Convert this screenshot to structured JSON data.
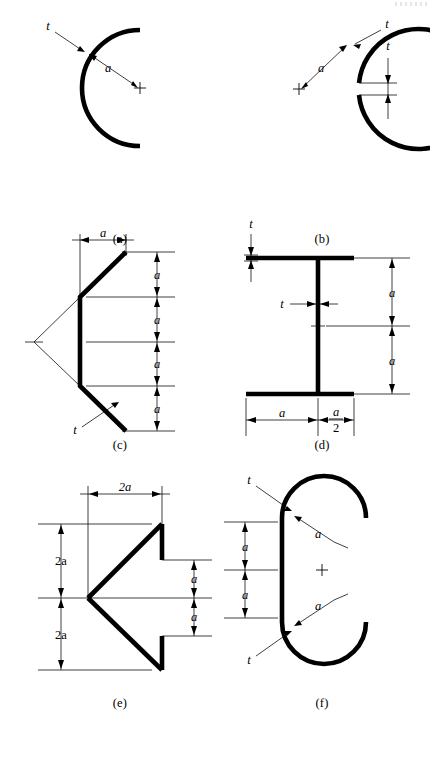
{
  "figure": {
    "panel_count": 6
  },
  "symbols": {
    "thickness": "t",
    "dimension": "a",
    "dimension_double": "2a",
    "fraction_numerator": "a",
    "fraction_denominator": "2"
  },
  "panels": [
    {
      "id": "a",
      "caption": "(a)",
      "shape": "open semicircular arc, slit on right side",
      "labels": {
        "t": "t",
        "a": "a"
      }
    },
    {
      "id": "b",
      "caption": "(b)",
      "shape": "closed circular ring with narrow slit at right",
      "labels": {
        "t_arc": "t",
        "a": "a",
        "t_gap": "t"
      }
    },
    {
      "id": "c",
      "caption": "(c)",
      "shape": "open zig-zag channel, four equal a segments",
      "labels": {
        "width": "a",
        "t": "t",
        "h1": "a",
        "h2": "a",
        "h3": "a",
        "h4": "a"
      }
    },
    {
      "id": "d",
      "caption": "(d)",
      "shape": "I-beam wide flange section",
      "labels": {
        "t_flange": "t",
        "t_web": "t",
        "h_top": "a",
        "h_bottom": "a",
        "w_left": "a",
        "w_right_num": "a",
        "w_right_den": "2"
      }
    },
    {
      "id": "e",
      "caption": "(e)",
      "shape": "open arrowhead / chevron section pointing left",
      "labels": {
        "width": "2a",
        "h_top": "2a",
        "h_bottom": "2a",
        "gap_top": "a",
        "gap_bottom": "a"
      }
    },
    {
      "id": "f",
      "caption": "(f)",
      "shape": "open stadium / C section with semicircular ends",
      "labels": {
        "t_top": "t",
        "a_top": "a",
        "a_left_upper": "a",
        "a_left_lower": "a",
        "a_bottom": "a",
        "t_bottom": "t"
      }
    }
  ],
  "colors": {
    "ink": "#000000",
    "paper": "#ffffff"
  }
}
